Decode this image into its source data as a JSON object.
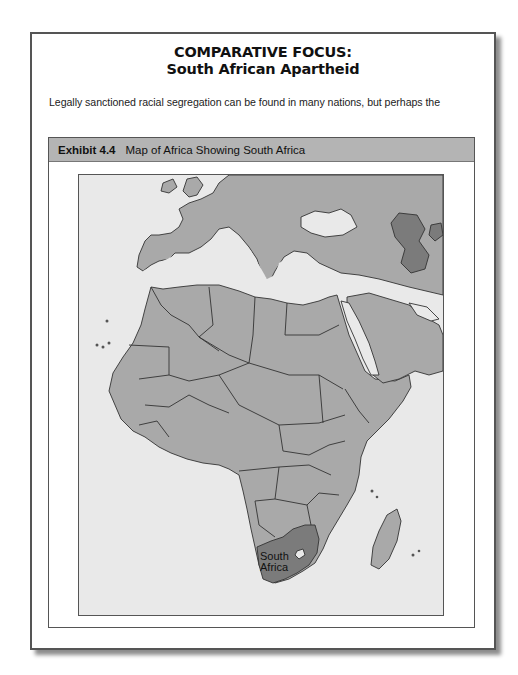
{
  "box": {
    "heading_line1": "COMPARATIVE FOCUS:",
    "heading_line2": "South African Apartheid",
    "body_text": "Legally sanctioned racial segregation can be found in many nations, but perhaps the"
  },
  "exhibit": {
    "number": "Exhibit 4.4",
    "title": "Map of Africa Showing South Africa",
    "map": {
      "highlight_label_line1": "South",
      "highlight_label_line2": "Africa",
      "colors": {
        "sea": "#e9e9e9",
        "land": "#a9a9a9",
        "highlight": "#7b7b7b",
        "border": "#333333",
        "header_bg": "#b4b4b4"
      }
    }
  }
}
